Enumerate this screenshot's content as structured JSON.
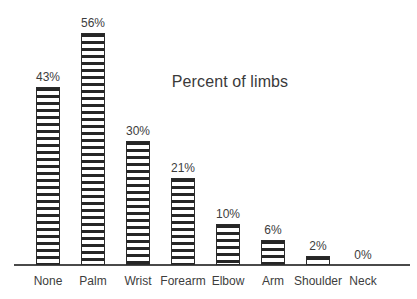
{
  "chart_data": {
    "type": "bar",
    "title": "Percent of limbs",
    "xlabel": "",
    "ylabel": "",
    "ylim": [
      0,
      60
    ],
    "grid": false,
    "legend": "none",
    "orientation": "vertical",
    "bar_fill": "horizontal-stripe-hatch",
    "categories": [
      "None",
      "Palm",
      "Wrist",
      "Forearm",
      "Elbow",
      "Arm",
      "Shoulder",
      "Neck"
    ],
    "values": [
      43,
      56,
      30,
      21,
      10,
      6,
      2,
      0
    ],
    "data_labels": [
      "43%",
      "56%",
      "30%",
      "21%",
      "10%",
      "6%",
      "2%",
      "0%"
    ],
    "axis_visible": {
      "x": true,
      "y": false
    }
  },
  "colors": {
    "background": "#ffffff",
    "axis": "#4a4a4a",
    "bar_border": "#2b2b2b",
    "bar_hatch": "#262626",
    "bar_ground": "#ffffff",
    "text": "#3d3d3d",
    "title_text": "#3a3a3a"
  },
  "bars": [
    {
      "category": "None",
      "value": 43,
      "label": "43%",
      "center_x": 48,
      "px_height": 178
    },
    {
      "category": "Palm",
      "value": 56,
      "label": "56%",
      "center_x": 93,
      "px_height": 232
    },
    {
      "category": "Wrist",
      "value": 30,
      "label": "30%",
      "center_x": 138,
      "px_height": 124
    },
    {
      "category": "Forearm",
      "value": 21,
      "label": "21%",
      "center_x": 183,
      "px_height": 87
    },
    {
      "category": "Elbow",
      "value": 10,
      "label": "10%",
      "center_x": 228,
      "px_height": 41
    },
    {
      "category": "Arm",
      "value": 6,
      "label": "6%",
      "center_x": 273,
      "px_height": 25
    },
    {
      "category": "Shoulder",
      "value": 2,
      "label": "2%",
      "center_x": 318,
      "px_height": 9
    },
    {
      "category": "Neck",
      "value": 0,
      "label": "0%",
      "center_x": 363,
      "px_height": 0
    }
  ]
}
